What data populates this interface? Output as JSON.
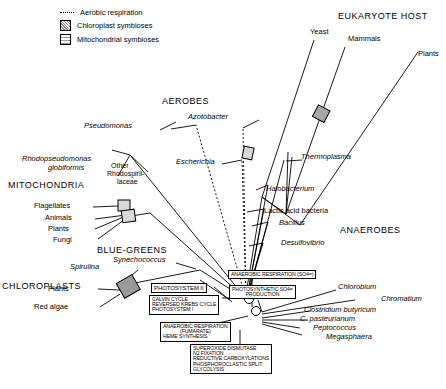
{
  "diagram": {
    "legend": {
      "items": [
        {
          "symbol": "dotted-line",
          "label": "Aerobic respiration"
        },
        {
          "symbol": "chloroplast-square",
          "label": "Chloroplast symbioses"
        },
        {
          "symbol": "mitochondrial-square",
          "label": "Mitochondrial symbioses"
        }
      ]
    },
    "group_headings": [
      {
        "id": "eukaryote-host",
        "label": "EUKARYOTE HOST"
      },
      {
        "id": "aerobes",
        "label": "AEROBES"
      },
      {
        "id": "anaerobes",
        "label": "ANAEROBES"
      },
      {
        "id": "mitochondria",
        "label": "MITOCHONDRIA"
      },
      {
        "id": "chloroplasts",
        "label": "CHLOROPLASTS"
      },
      {
        "id": "blue-greens",
        "label": "BLUE-GREENS"
      }
    ],
    "host_taxa": [
      {
        "id": "yeast",
        "label": "Yeast"
      },
      {
        "id": "mammals",
        "label": "Mammals"
      },
      {
        "id": "plants-host",
        "label": "Plants"
      }
    ],
    "mitochondria_hosts": [
      {
        "id": "flagellates",
        "label": "Flagellates"
      },
      {
        "id": "animals",
        "label": "Animals"
      },
      {
        "id": "plants-mito",
        "label": "Plants"
      },
      {
        "id": "fungi",
        "label": "Fungi"
      }
    ],
    "chloroplast_hosts": [
      {
        "id": "plants-chloro",
        "label": "Plants"
      },
      {
        "id": "red-algae",
        "label": "Red algae"
      }
    ],
    "bacteria": [
      {
        "id": "pseudomonas",
        "label": "Pseudomonas",
        "italic": true
      },
      {
        "id": "azotobacter",
        "label": "Azotobacter",
        "italic": true
      },
      {
        "id": "escherichia",
        "label": "Escherichia",
        "italic": true
      },
      {
        "id": "rhodopseudomonas",
        "label": "Rhodopseudomonas",
        "italic": true
      },
      {
        "id": "globiformis",
        "label": "globiformis",
        "italic": true
      },
      {
        "id": "other-rhodo-1",
        "label": "Other",
        "italic": false
      },
      {
        "id": "other-rhodo-2",
        "label": "Rhodospiril-",
        "italic": false
      },
      {
        "id": "other-rhodo-3",
        "label": "laceae",
        "italic": false
      },
      {
        "id": "thermoplasma",
        "label": "Thermoplasma",
        "italic": true
      },
      {
        "id": "halobacterium",
        "label": "Halobacterium",
        "italic": true
      },
      {
        "id": "lactic-acid-bacteria",
        "label": "Lactic acid bacteria",
        "italic": false
      },
      {
        "id": "bacillus",
        "label": "Bacillus",
        "italic": true
      },
      {
        "id": "desulfovibrio",
        "label": "Desulfovibrio",
        "italic": true
      },
      {
        "id": "chlorobium",
        "label": "Chlorobium",
        "italic": true
      },
      {
        "id": "chromatium",
        "label": "Chromatium",
        "italic": true
      },
      {
        "id": "clostridium-butyricum",
        "label": "Clostridium butyricum",
        "italic": true
      },
      {
        "id": "c-pasteurianum",
        "label": "C. pasteurianum",
        "italic": true
      },
      {
        "id": "peptococcus",
        "label": "Peptococcus",
        "italic": true
      },
      {
        "id": "megasphaera",
        "label": "Megasphaera",
        "italic": true
      },
      {
        "id": "spirulina",
        "label": "Spirulina",
        "italic": true
      },
      {
        "id": "synechococcus",
        "label": "Synechococcus",
        "italic": true
      }
    ],
    "pathway_boxes": [
      {
        "id": "photosystem-ii",
        "lines": [
          "PHOTOSYSTEM II"
        ]
      },
      {
        "id": "calvin-cycle",
        "lines": [
          "CALVIN CYCLE",
          "REVERSED KREBS CYCLE",
          "PHOTOSYSTEM I"
        ]
      },
      {
        "id": "anaerobic-respiration-fumarate",
        "lines": [
          "ANAEROBIC RESPIRATION",
          "(FUMARATE)",
          "HEME SYNTHESIS"
        ]
      },
      {
        "id": "anaerobic-respiration-so4",
        "lines": [
          "ANAEROBIC RESPIRATION (SO4=)"
        ]
      },
      {
        "id": "photosynthetic-so4",
        "lines": [
          "PHOTOSYNTHETIC SO4=",
          "PRODUCTION"
        ]
      },
      {
        "id": "core-pathways",
        "lines": [
          "SUPEROXIDE DISMUTASE",
          "N2 FIXATION",
          "REDUCTIVE CARBOXYLATIONS",
          "PHOSPHOROCLASTIC SPLIT",
          "GLYCOLYSIS"
        ]
      }
    ]
  }
}
